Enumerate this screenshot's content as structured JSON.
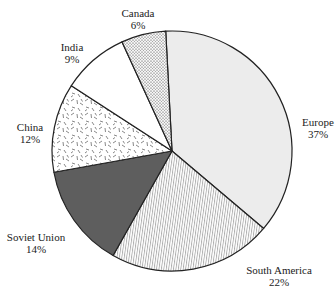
{
  "chart_data": {
    "type": "pie",
    "title": "",
    "slices": [
      {
        "label": "Europe",
        "value": 37,
        "pct_text": "37%",
        "pattern": "light-gray",
        "label_pos": [
          318,
          116
        ]
      },
      {
        "label": "South America",
        "value": 22,
        "pct_text": "22%",
        "pattern": "vertical-lines",
        "label_pos": [
          279,
          264
        ]
      },
      {
        "label": "Soviet Union",
        "value": 14,
        "pct_text": "14%",
        "pattern": "dark-gray",
        "label_pos": [
          36,
          231
        ]
      },
      {
        "label": "China",
        "value": 12,
        "pct_text": "12%",
        "pattern": "dashes",
        "label_pos": [
          30,
          121
        ]
      },
      {
        "label": "India",
        "value": 9,
        "pct_text": "9%",
        "pattern": "white",
        "label_pos": [
          72,
          41
        ]
      },
      {
        "label": "Canada",
        "value": 6,
        "pct_text": "6%",
        "pattern": "dots",
        "label_pos": [
          138,
          7
        ]
      }
    ],
    "start_angle_deg": -3,
    "direction": "clockwise",
    "center": [
      172,
      151
    ],
    "radius": 120,
    "legend": "none (inline labels)"
  }
}
